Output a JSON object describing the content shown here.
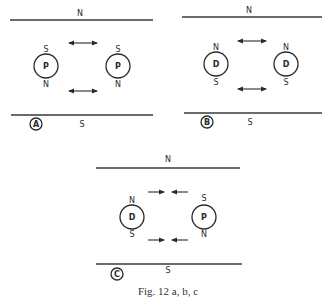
{
  "figure": {
    "caption": "Fig. 12 a, b, c",
    "panels": [
      {
        "id": "A",
        "label": "A",
        "top_pole": "N",
        "bottom_pole": "S",
        "bodies": [
          {
            "type": "P",
            "pole_top": "S",
            "pole_bottom": "N"
          },
          {
            "type": "P",
            "pole_top": "S",
            "pole_bottom": "N"
          }
        ],
        "force": "bidirectional (repulsion/oscillation)"
      },
      {
        "id": "B",
        "label": "B",
        "top_pole": "N",
        "bottom_pole": "S",
        "bodies": [
          {
            "type": "D",
            "pole_top": "N",
            "pole_bottom": "S"
          },
          {
            "type": "D",
            "pole_top": "N",
            "pole_bottom": "S"
          }
        ],
        "force": "bidirectional (repulsion/oscillation)"
      },
      {
        "id": "C",
        "label": "C",
        "top_pole": "N",
        "bottom_pole": "S",
        "bodies": [
          {
            "type": "D",
            "pole_top": "N",
            "pole_bottom": "S"
          },
          {
            "type": "P",
            "pole_top": "S",
            "pole_bottom": "N"
          }
        ],
        "force": "converging (attraction)"
      }
    ]
  }
}
